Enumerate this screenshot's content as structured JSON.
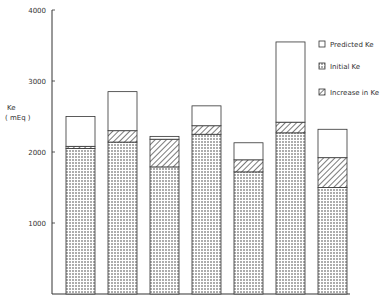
{
  "chart_data": {
    "type": "bar",
    "stacked": true,
    "title": "",
    "xlabel": "",
    "ylabel": "Ke",
    "ylabel_unit": "( mEq )",
    "ylim": [
      0,
      4000
    ],
    "yticks": [
      1000,
      2000,
      3000,
      4000
    ],
    "ytick_labels": [
      "1000",
      "2000",
      "3000",
      "4000"
    ],
    "grid": false,
    "legend_position": "upper right",
    "categories": [
      "1",
      "2",
      "3",
      "4",
      "5",
      "6",
      "7"
    ],
    "series": [
      {
        "name": "Initial Ke",
        "pattern": "dots",
        "values": [
          2050,
          2140,
          1790,
          2250,
          1720,
          2270,
          1500
        ]
      },
      {
        "name": "Increase in Ke",
        "pattern": "hatch",
        "values": [
          30,
          160,
          390,
          120,
          170,
          150,
          420
        ]
      },
      {
        "name": "Predicted Ke",
        "pattern": "empty",
        "values": [
          420,
          550,
          40,
          280,
          240,
          1130,
          400
        ]
      }
    ],
    "totals": [
      2500,
      2850,
      2220,
      2650,
      2130,
      3550,
      2320
    ]
  },
  "legend": {
    "items": [
      {
        "label": "Predicted Ke",
        "pattern": "empty"
      },
      {
        "label": "Initial Ke",
        "pattern": "dots"
      },
      {
        "label": "Increase in Ke",
        "pattern": "hatch"
      }
    ]
  },
  "axis": {
    "ylabel_line1": "Ke",
    "ylabel_line2": "( mEq )"
  },
  "colors": {
    "ink": "#333333",
    "background": "#ffffff"
  }
}
